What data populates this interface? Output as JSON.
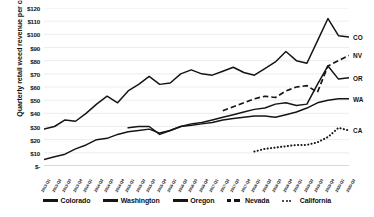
{
  "chart_data": {
    "type": "line",
    "title": "",
    "xlabel": "",
    "ylabel": "Quarterly retail weed revenue per capita",
    "ylim": [
      0,
      120
    ],
    "ytick_labels": [
      "$120",
      "$110",
      "$100",
      "$90",
      "$80",
      "$70",
      "$60",
      "$50",
      "$40",
      "$30",
      "$20",
      "$10",
      "$-"
    ],
    "ytick_values": [
      120,
      110,
      100,
      90,
      80,
      70,
      60,
      50,
      40,
      30,
      20,
      10,
      0
    ],
    "grid": true,
    "legend_position": "bottom",
    "categories": [
      "2013-Q1",
      "2013-Q2",
      "2013-Q3",
      "2013-Q4",
      "2014-Q1",
      "2014-Q2",
      "2014-Q3",
      "2014-Q4",
      "2015-Q1",
      "2015-Q2",
      "2015-Q3",
      "2015-Q4",
      "2016-Q1",
      "2016-Q2",
      "2016-Q3",
      "2016-Q4",
      "2017-Q1",
      "2017-Q2",
      "2017-Q3",
      "2017-Q4",
      "2018-Q1",
      "2018-Q2",
      "2018-Q3",
      "2018-Q4",
      "2019-Q1",
      "2019-Q2",
      "2019-Q3",
      "2019-Q4",
      "2020-Q1",
      "2020-Q2"
    ],
    "series": [
      {
        "name": "Colorado",
        "short": "CO",
        "style": "solid",
        "start_index": 0,
        "values": [
          28,
          30,
          35,
          34,
          40,
          47,
          53,
          48,
          57,
          62,
          68,
          62,
          63,
          70,
          73,
          70,
          69,
          72,
          75,
          71,
          69,
          74,
          79,
          87,
          80,
          78,
          95,
          112,
          99,
          98
        ]
      },
      {
        "name": "Washington",
        "short": "WA",
        "style": "solid",
        "start_index": 0,
        "values": [
          5,
          7,
          9,
          13,
          16,
          20,
          21,
          24,
          26,
          27,
          28,
          25,
          27,
          30,
          31,
          32,
          33,
          35,
          36,
          37,
          38,
          38,
          37,
          39,
          41,
          44,
          48,
          50,
          51,
          51
        ]
      },
      {
        "name": "Oregon",
        "short": "OR",
        "style": "solid",
        "start_index": 8,
        "values": [
          null,
          null,
          null,
          null,
          null,
          null,
          null,
          null,
          29,
          30,
          30,
          24,
          27,
          30,
          32,
          33,
          35,
          37,
          39,
          41,
          43,
          44,
          47,
          48,
          46,
          47,
          62,
          76,
          66,
          67
        ]
      },
      {
        "name": "Nevada",
        "short": "NV",
        "style": "dashed",
        "start_index": 17,
        "values": [
          null,
          null,
          null,
          null,
          null,
          null,
          null,
          null,
          null,
          null,
          null,
          null,
          null,
          null,
          null,
          null,
          null,
          42,
          45,
          48,
          51,
          53,
          52,
          57,
          60,
          61,
          56,
          76,
          80,
          84
        ]
      },
      {
        "name": "California",
        "short": "CA",
        "style": "dotted",
        "start_index": 20,
        "values": [
          null,
          null,
          null,
          null,
          null,
          null,
          null,
          null,
          null,
          null,
          null,
          null,
          null,
          null,
          null,
          null,
          null,
          null,
          null,
          null,
          11,
          13,
          14,
          15,
          16,
          16,
          18,
          22,
          29,
          27
        ]
      }
    ]
  },
  "legend": {
    "items": [
      {
        "label": "Colorado",
        "style": "solid"
      },
      {
        "label": "Washington",
        "style": "solid"
      },
      {
        "label": "Oregon",
        "style": "solid"
      },
      {
        "label": "Nevada",
        "style": "dashed"
      },
      {
        "label": "California",
        "style": "dotted"
      }
    ]
  }
}
